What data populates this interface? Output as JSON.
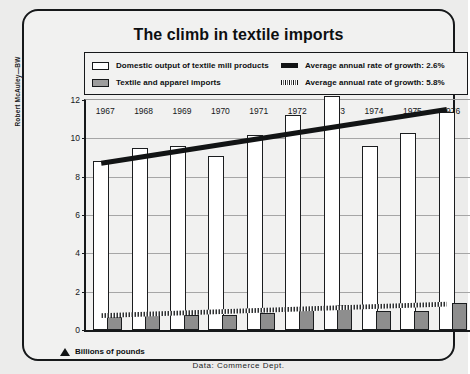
{
  "figure": {
    "credit": "Robert McAuley—BW",
    "title": "The climb in textile imports",
    "axis_note": "Billions of pounds",
    "axis_note_icon": "triangle-up-icon",
    "source": "Data: Commerce Dept."
  },
  "legend": {
    "items": [
      {
        "label": "Domestic output of textile mill products",
        "swatch": "open-square-swatch",
        "column": "left"
      },
      {
        "label": "Textile and apparel imports",
        "swatch": "shaded-square-swatch",
        "column": "left"
      },
      {
        "label": "Average annual rate of growth: 2.6%",
        "swatch": "solid-trendline-swatch",
        "column": "right"
      },
      {
        "label": "Average annual rate of growth: 5.8%",
        "swatch": "hatched-trendline-swatch",
        "column": "right"
      }
    ]
  },
  "colors": {
    "domestic_fill": "#ffffff",
    "import_fill": "#8e8e8e",
    "ink": "#16181a",
    "panel": "#f1f1f0",
    "grid": "#a6a6a6"
  },
  "chart_data": {
    "type": "bar",
    "title": "The climb in textile imports",
    "subtitle": "",
    "xlabel": "",
    "ylabel": "Billions of pounds",
    "ylim": [
      0,
      12
    ],
    "yticks": [
      0,
      2,
      4,
      6,
      8,
      10,
      12
    ],
    "grid": true,
    "legend_position": "top",
    "categories": [
      "1967",
      "1968",
      "1969",
      "1970",
      "1971",
      "1972",
      "1973",
      "1974",
      "1975",
      "1976"
    ],
    "series": [
      {
        "name": "Domestic output of textile mill products",
        "values": [
          8.8,
          9.5,
          9.6,
          9.1,
          10.2,
          11.2,
          12.2,
          9.6,
          10.3,
          11.4
        ]
      },
      {
        "name": "Textile and apparel imports",
        "values": [
          0.7,
          0.9,
          0.8,
          0.8,
          0.9,
          1.1,
          1.3,
          1.0,
          1.0,
          1.4
        ]
      }
    ],
    "annotations": [
      {
        "name": "trend-domestic",
        "label": "Average annual rate of growth: 2.6%",
        "style": "solid",
        "from": [
          0,
          8.7
        ],
        "to": [
          9,
          11.5
        ]
      },
      {
        "name": "trend-imports",
        "label": "Average annual rate of growth: 5.8%",
        "style": "hatched",
        "from": [
          0,
          0.75
        ],
        "to": [
          9,
          1.35
        ]
      }
    ],
    "source": "Data: Commerce Dept."
  }
}
